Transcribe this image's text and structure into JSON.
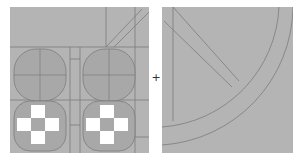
{
  "figure": {
    "type": "geometric tile construction diagram",
    "operator_symbol": "+",
    "panels": [
      {
        "id": "left",
        "description": "square tile with four rounded-rectangle lobes, two with white checker crosses, diagonal band at top right",
        "fill": "#b4b4b4",
        "line_color": "#808080",
        "white_squares_per_cross": 4,
        "cross_count": 2
      },
      {
        "id": "right",
        "description": "square tile with diagonal band meeting a quarter-circle ring arc",
        "fill": "#b4b4b4",
        "line_color": "#808080"
      }
    ]
  },
  "colors": {
    "background": "#ffffff",
    "panel_fill": "#b4b4b4",
    "shape_fill": "#a8a8a8",
    "line": "#7c7c7c",
    "highlight": "#ffffff"
  }
}
